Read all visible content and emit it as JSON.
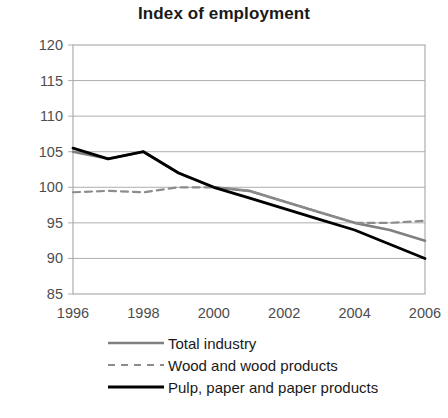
{
  "chart_data": {
    "type": "line",
    "title": "Index of employment",
    "xlabel": "",
    "ylabel": "",
    "xlim": [
      1996,
      2006
    ],
    "ylim": [
      85,
      120
    ],
    "grid": true,
    "grid_axis": "y",
    "legend_position": "bottom",
    "x": [
      1996,
      1997,
      1998,
      1999,
      2000,
      2001,
      2002,
      2003,
      2004,
      2005,
      2006
    ],
    "xticks": [
      "1996",
      "1998",
      "2000",
      "2002",
      "2004",
      "2006"
    ],
    "xtick_values": [
      1996,
      1998,
      2000,
      2002,
      2004,
      2006
    ],
    "yticks": [
      "85",
      "90",
      "95",
      "100",
      "105",
      "110",
      "115",
      "120"
    ],
    "ytick_values": [
      85,
      90,
      95,
      100,
      105,
      110,
      115,
      120
    ],
    "series": [
      {
        "name": "Total industry",
        "color": "#808080",
        "style": "solid",
        "width": 2.6,
        "values": [
          105.0,
          104.0,
          105.0,
          102.0,
          100.0,
          99.5,
          98.0,
          96.5,
          95.0,
          94.0,
          92.5
        ]
      },
      {
        "name": "Wood and wood products",
        "color": "#8c8c8c",
        "style": "dashed",
        "width": 2.2,
        "values": [
          99.3,
          99.5,
          99.3,
          100.0,
          100.0,
          99.5,
          98.0,
          96.5,
          95.0,
          95.0,
          95.3
        ]
      },
      {
        "name": "Pulp, paper and paper products",
        "color": "#000000",
        "style": "solid",
        "width": 2.8,
        "values": [
          105.5,
          104.0,
          105.0,
          102.0,
          100.0,
          98.5,
          97.0,
          95.5,
          94.0,
          92.0,
          90.0
        ]
      }
    ]
  },
  "legend": {
    "items": [
      {
        "label": "Total industry"
      },
      {
        "label": "Wood and wood products"
      },
      {
        "label": "Pulp, paper and paper products"
      }
    ]
  }
}
